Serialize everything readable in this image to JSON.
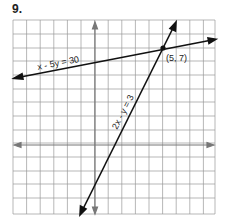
{
  "problem_number": "9.",
  "graph": {
    "lines": [
      {
        "equation": "x - 5y = 30",
        "label": "x - 5y = 30"
      },
      {
        "equation": "2x - y = 3",
        "label": "2x - y = 3"
      }
    ],
    "intersection": {
      "label": "(5, 7)",
      "x": 5,
      "y": 7
    },
    "grid": {
      "columns": 15,
      "rows": 14,
      "cell_px": 13.6
    }
  }
}
